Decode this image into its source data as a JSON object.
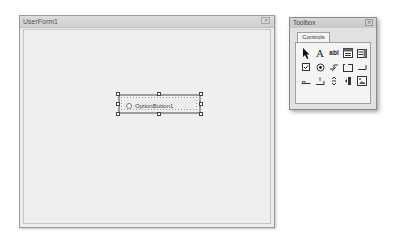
{
  "userform": {
    "title": "UserForm1",
    "close_glyph": "✕",
    "controls": [
      {
        "type": "OptionButton",
        "label": "OptionButton1",
        "selected": true
      }
    ]
  },
  "toolbox": {
    "title": "Toolbox",
    "close_glyph": "✕",
    "tabs": [
      {
        "label": "Controls",
        "active": true
      }
    ],
    "tools": [
      {
        "name": "select-objects",
        "glyph": "➤"
      },
      {
        "name": "label",
        "glyph": "A"
      },
      {
        "name": "textbox",
        "glyph": "abl"
      },
      {
        "name": "combobox",
        "glyph": ""
      },
      {
        "name": "listbox",
        "glyph": ""
      },
      {
        "name": "checkbox",
        "glyph": ""
      },
      {
        "name": "optionbutton",
        "glyph": ""
      },
      {
        "name": "togglebutton",
        "glyph": ""
      },
      {
        "name": "frame",
        "glyph": ""
      },
      {
        "name": "commandbutton",
        "glyph": ""
      },
      {
        "name": "tabstrip",
        "glyph": ""
      },
      {
        "name": "multipage",
        "glyph": ""
      },
      {
        "name": "scrollbar",
        "glyph": ""
      },
      {
        "name": "spinbutton",
        "glyph": ""
      },
      {
        "name": "image",
        "glyph": ""
      }
    ]
  }
}
